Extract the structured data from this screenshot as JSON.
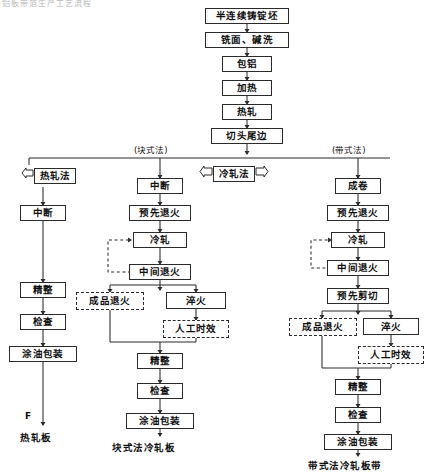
{
  "figure": {
    "title_fragment": "铝板带箔生产工艺流程",
    "type": "process-flowchart"
  },
  "trunk": {
    "nodes": [
      {
        "id": "trunk-1",
        "label": "半连续铸锭坯",
        "style": "solid"
      },
      {
        "id": "trunk-2",
        "label": "铣面、碱洗",
        "style": "solid"
      },
      {
        "id": "trunk-3",
        "label": "包铝",
        "style": "solid"
      },
      {
        "id": "trunk-4",
        "label": "加热",
        "style": "solid"
      },
      {
        "id": "trunk-5",
        "label": "热轧",
        "style": "solid"
      },
      {
        "id": "trunk-6",
        "label": "切头尾边",
        "style": "solid"
      }
    ]
  },
  "banners": [
    {
      "id": "banner-hot",
      "label": "热轧法",
      "wings": "left"
    },
    {
      "id": "banner-cold",
      "label": "冷轧法",
      "wings": "both"
    }
  ],
  "branch_labels": [
    {
      "id": "label-block",
      "text": "(块式法)"
    },
    {
      "id": "label-strip",
      "text": "(带式法)"
    }
  ],
  "columns": [
    {
      "id": "col-hot",
      "name": "热轧法",
      "product": "热轧板",
      "marker": "F",
      "nodes": [
        {
          "id": "hot-1",
          "label": "中断",
          "style": "solid"
        },
        {
          "id": "hot-2",
          "label": "精整",
          "style": "solid"
        },
        {
          "id": "hot-3",
          "label": "检查",
          "style": "solid"
        },
        {
          "id": "hot-4",
          "label": "涂油包装",
          "style": "solid"
        }
      ]
    },
    {
      "id": "col-block",
      "name": "块式法",
      "product": "块式法冷轧板",
      "nodes": [
        {
          "id": "blk-1",
          "label": "中断",
          "style": "solid"
        },
        {
          "id": "blk-2",
          "label": "预先退火",
          "style": "solid"
        },
        {
          "id": "blk-3",
          "label": "冷轧",
          "style": "solid"
        },
        {
          "id": "blk-4",
          "label": "中间退火",
          "style": "solid"
        },
        {
          "id": "blk-5",
          "label": "成品退火",
          "style": "dashed"
        },
        {
          "id": "blk-6",
          "label": "淬火",
          "style": "solid"
        },
        {
          "id": "blk-7",
          "label": "人工时效",
          "style": "dashed"
        },
        {
          "id": "blk-8",
          "label": "精整",
          "style": "solid"
        },
        {
          "id": "blk-9",
          "label": "检查",
          "style": "solid"
        },
        {
          "id": "blk-10",
          "label": "涂油包装",
          "style": "solid"
        }
      ]
    },
    {
      "id": "col-strip",
      "name": "带式法",
      "product": "带式法冷轧板带",
      "nodes": [
        {
          "id": "str-1",
          "label": "成卷",
          "style": "solid"
        },
        {
          "id": "str-2",
          "label": "预先退火",
          "style": "solid"
        },
        {
          "id": "str-3",
          "label": "冷轧",
          "style": "solid"
        },
        {
          "id": "str-4",
          "label": "中间退火",
          "style": "solid"
        },
        {
          "id": "str-5",
          "label": "预先剪切",
          "style": "solid"
        },
        {
          "id": "str-6",
          "label": "成品退火",
          "style": "dashed"
        },
        {
          "id": "str-7",
          "label": "淬火",
          "style": "solid"
        },
        {
          "id": "str-8",
          "label": "人工时效",
          "style": "dashed"
        },
        {
          "id": "str-9",
          "label": "精整",
          "style": "solid"
        },
        {
          "id": "str-10",
          "label": "检查",
          "style": "solid"
        },
        {
          "id": "str-11",
          "label": "涂油包装",
          "style": "solid"
        }
      ]
    }
  ],
  "colors": {
    "line": "#2b2b2b",
    "box_fill": "#ffffff",
    "text": "#101010",
    "background": "#ffffff"
  }
}
